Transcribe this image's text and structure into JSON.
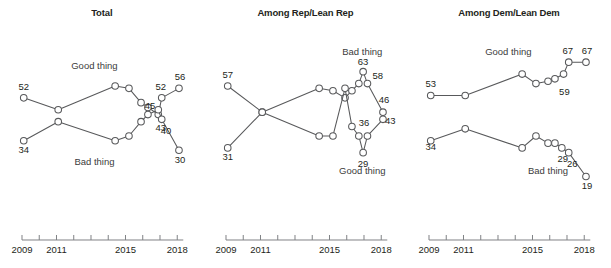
{
  "chart_data": {
    "type": "line",
    "title": "",
    "xlabel": "",
    "ylabel": "",
    "xlim": [
      2009,
      2018.6
    ],
    "ylim": [
      15,
      70
    ],
    "grid": false,
    "legend_position": "inline-annotations",
    "axis_ticks": [
      2009,
      2010,
      2011,
      2012,
      2013,
      2014,
      2015,
      2016,
      2017,
      2018
    ],
    "axis_tick_labels": [
      "2009",
      "2011",
      "2015",
      "2018"
    ],
    "panels": [
      {
        "title": "Total",
        "series": [
          {
            "name": "Good thing",
            "label": "Good thing",
            "x": [
              2009.1,
              2011.1,
              2014.4,
              2015.2,
              2015.9,
              2016.3,
              2016.9,
              2017.1,
              2018.1
            ],
            "values": [
              52,
              47,
              57,
              56,
              50,
              48,
              45,
              52,
              56
            ],
            "point_labels": {
              "0": "52",
              "6": "45",
              "7": "52",
              "8": "56"
            }
          },
          {
            "name": "Bad thing",
            "label": "Bad thing",
            "x": [
              2009.1,
              2011.1,
              2014.4,
              2015.2,
              2015.9,
              2016.3,
              2016.9,
              2017.1,
              2018.1
            ],
            "values": [
              34,
              42,
              34,
              36,
              42,
              45,
              47,
              43,
              30
            ],
            "point_labels": {
              "0": "34",
              "7": "43",
              "8": "30"
            },
            "extra_labels": [
              {
                "text": "40",
                "x": 2017.35,
                "y": 37
              }
            ]
          }
        ]
      },
      {
        "title": "Among Rep/Lean Rep",
        "series": [
          {
            "name": "Bad thing",
            "label": "Bad thing",
            "x": [
              2009.1,
              2011.1,
              2014.4,
              2015.2,
              2015.9,
              2016.3,
              2016.7,
              2016.95,
              2017.2,
              2018.1
            ],
            "values": [
              31,
              46,
              56,
              55,
              52,
              55,
              58,
              63,
              58,
              46
            ],
            "point_labels": {
              "0": "31",
              "7": "63",
              "8": "58",
              "9": "46"
            }
          },
          {
            "name": "Good thing",
            "label": "Good thing",
            "x": [
              2009.1,
              2011.1,
              2014.4,
              2015.2,
              2015.9,
              2016.3,
              2016.7,
              2016.95,
              2017.2,
              2018.1
            ],
            "values": [
              57,
              46,
              36,
              36,
              56,
              40,
              36,
              29,
              36,
              43
            ],
            "point_labels": {
              "0": "57",
              "7": "29",
              "9": "43"
            },
            "extra_labels": [
              {
                "text": "36",
                "x": 2017.0,
                "y": 40
              }
            ]
          }
        ]
      },
      {
        "title": "Among Dem/Lean Dem",
        "series": [
          {
            "name": "Good thing",
            "label": "Good thing",
            "x": [
              2009.1,
              2011.1,
              2014.4,
              2015.2,
              2015.9,
              2016.3,
              2016.8,
              2017.1,
              2018.1
            ],
            "values": [
              53,
              53,
              62,
              58,
              59,
              60,
              62,
              67,
              67
            ],
            "point_labels": {
              "0": "53",
              "7": "67",
              "8": "67"
            },
            "extra_labels": [
              {
                "text": "59",
                "x": 2016.85,
                "y": 53
              }
            ]
          },
          {
            "name": "Bad thing",
            "label": "Bad thing",
            "x": [
              2009.1,
              2011.1,
              2014.4,
              2015.2,
              2015.9,
              2016.3,
              2016.7,
              2017.1,
              2018.1
            ],
            "values": [
              34,
              39,
              31,
              36,
              33,
              33,
              31,
              29,
              19
            ],
            "point_labels": {
              "8": "19"
            },
            "extra_labels": [
              {
                "text": "34",
                "x": 2009.1,
                "y": 30
              },
              {
                "text": "29",
                "x": 2016.75,
                "y": 25
              },
              {
                "text": "26",
                "x": 2017.3,
                "y": 23
              }
            ]
          }
        ]
      }
    ]
  }
}
